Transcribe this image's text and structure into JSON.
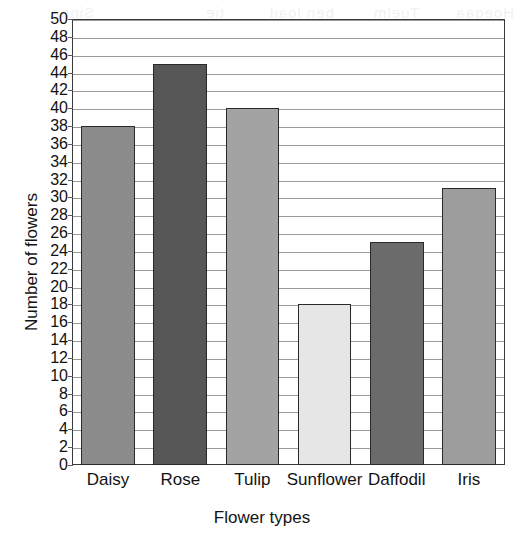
{
  "chart_data": {
    "type": "bar",
    "title": "",
    "xlabel": "Flower types",
    "ylabel": "Number of flowers",
    "categories": [
      "Daisy",
      "Rose",
      "Tulip",
      "Sunflower",
      "Daffodil",
      "Iris"
    ],
    "values": [
      38,
      45,
      40,
      18,
      25,
      31
    ],
    "ylim": [
      0,
      50
    ],
    "ytick_step": 2,
    "yticks": [
      0,
      2,
      4,
      6,
      8,
      10,
      12,
      14,
      16,
      18,
      20,
      22,
      24,
      26,
      28,
      30,
      32,
      34,
      36,
      38,
      40,
      42,
      44,
      46,
      48,
      50
    ],
    "ytick_labels": [
      "0",
      "2",
      "4",
      "6",
      "8",
      "10",
      "12",
      "14",
      "16",
      "18",
      "20",
      "22",
      "24",
      "26",
      "28",
      "30",
      "32",
      "34",
      "36",
      "38",
      "40",
      "42",
      "44",
      "46",
      "48",
      "50"
    ],
    "grid": true,
    "grid_axis": "y",
    "legend": false,
    "bar_colors": [
      "#8b8b8b",
      "#575757",
      "#a3a3a3",
      "#e6e6e6",
      "#6b6b6b",
      "#9d9d9d"
    ],
    "bar_edge_color": "#2a2a2a",
    "grid_color": "#9a9a9a",
    "axis_color": "#3a3a3a",
    "background": "#ffffff",
    "annotations": []
  },
  "scan_ghost": {
    "fragments": [
      "Hoegaa",
      "Tuelm",
      "ben loait",
      "tie",
      "Sinoe"
    ]
  }
}
